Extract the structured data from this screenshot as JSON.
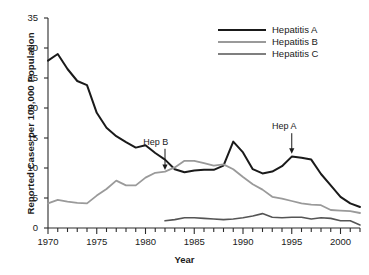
{
  "chart_data": {
    "type": "line",
    "title": "",
    "xlabel": "Year",
    "ylabel": "Reported Cases per 100,000 Population",
    "xlim": [
      1970,
      2002
    ],
    "ylim": [
      0,
      35
    ],
    "grid": false,
    "legend_position": "top-right",
    "x_ticks_major": [
      "1970",
      "1975",
      "1980",
      "1985",
      "1990",
      "1995",
      "2000"
    ],
    "x_ticks_major_values": [
      1970,
      1975,
      1980,
      1985,
      1990,
      1995,
      2000
    ],
    "x_minor_tick_interval": 1,
    "y_ticks": [
      "0",
      "5",
      "10",
      "15",
      "20",
      "25",
      "30",
      "35"
    ],
    "y_tick_values": [
      0,
      5,
      10,
      15,
      20,
      25,
      30,
      35
    ],
    "x": [
      1970,
      1971,
      1972,
      1973,
      1974,
      1975,
      1976,
      1977,
      1978,
      1979,
      1980,
      1981,
      1982,
      1983,
      1984,
      1985,
      1986,
      1987,
      1988,
      1989,
      1990,
      1991,
      1992,
      1993,
      1994,
      1995,
      1996,
      1997,
      1998,
      1999,
      2000,
      2001,
      2002
    ],
    "series": [
      {
        "name": "Hepatitis A",
        "color": "#1a1a1a",
        "width": 2.0,
        "values": [
          27.9,
          29.0,
          26.5,
          24.5,
          23.8,
          19.2,
          16.7,
          15.3,
          14.3,
          13.4,
          13.8,
          12.5,
          11.4,
          9.8,
          9.3,
          9.6,
          9.7,
          9.7,
          10.4,
          14.4,
          12.6,
          9.8,
          9.1,
          9.4,
          10.3,
          11.9,
          11.7,
          11.4,
          9.0,
          7.1,
          5.2,
          4.1,
          3.5
        ]
      },
      {
        "name": "Hepatitis B",
        "color": "#9a9a9a",
        "width": 1.8,
        "values": [
          4.1,
          4.7,
          4.4,
          4.2,
          4.1,
          5.4,
          6.5,
          7.9,
          7.1,
          7.1,
          8.4,
          9.2,
          9.4,
          10.1,
          11.2,
          11.2,
          10.8,
          10.4,
          10.6,
          9.8,
          8.5,
          7.3,
          6.4,
          5.2,
          4.9,
          4.5,
          4.1,
          3.9,
          3.8,
          3.0,
          2.9,
          2.8,
          2.5
        ]
      },
      {
        "name": "Hepatitis C",
        "color": "#555555",
        "width": 1.6,
        "values": [
          null,
          null,
          null,
          null,
          null,
          null,
          null,
          null,
          null,
          null,
          null,
          null,
          1.2,
          1.4,
          1.7,
          1.7,
          1.6,
          1.5,
          1.4,
          1.5,
          1.7,
          2.0,
          2.4,
          1.8,
          1.7,
          1.8,
          1.8,
          1.5,
          1.7,
          1.6,
          1.2,
          1.2,
          0.5
        ]
      }
    ],
    "annotations": [
      {
        "label": "Hep B",
        "x": 1982,
        "y": 9.6,
        "text_x": 1981.0,
        "text_y": 14.2
      },
      {
        "label": "Hep A",
        "x": 1995,
        "y": 12.3,
        "text_x": 1994.2,
        "text_y": 16.8
      }
    ]
  },
  "legend": {
    "items": [
      {
        "label": "Hepatitis A"
      },
      {
        "label": "Hepatitis B"
      },
      {
        "label": "Hepatitis C"
      }
    ]
  }
}
